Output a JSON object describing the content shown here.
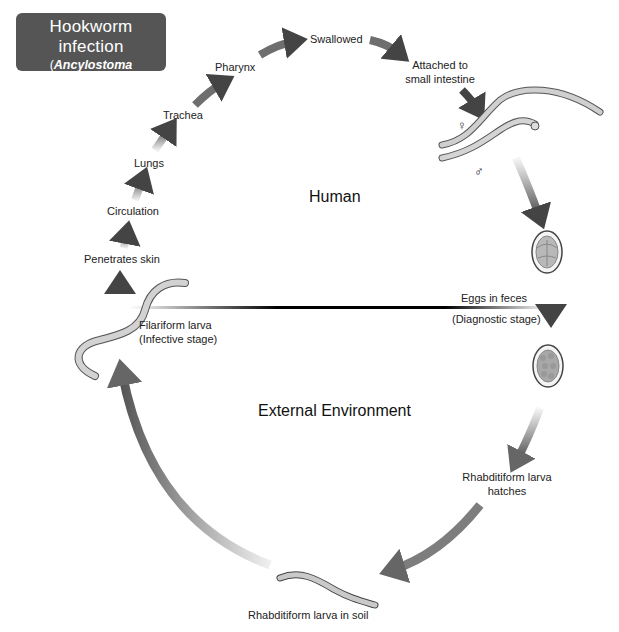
{
  "title": {
    "main": "Hookworm infection",
    "species_line1": "Ancylostoma duodenale,",
    "species_line2": "Necator americanus",
    "open_paren": "(",
    "close_paren": ")"
  },
  "regions": {
    "human": "Human",
    "external": "External Environment"
  },
  "stages": {
    "swallowed": "Swallowed",
    "attached_line1": "Attached to",
    "attached_line2": "small intestine",
    "pharynx": "Pharynx",
    "trachea": "Trachea",
    "lungs": "Lungs",
    "circulation": "Circulation",
    "penetrates_skin": "Penetrates skin",
    "filariform_line1": "Filariform larva",
    "filariform_line2": "(Infective stage)",
    "eggs_in_feces": "Eggs in feces",
    "diagnostic_stage": "(Diagnostic stage)",
    "rhabditiform_hatches_line1": "Rhabditiform larva",
    "rhabditiform_hatches_line2": "hatches",
    "rhabditiform_soil": "Rhabditiform larva in soil"
  },
  "symbols": {
    "female": "♀",
    "male": "♂"
  },
  "colors": {
    "title_bg": "#555555",
    "arrow": "#4a4a4a",
    "divider": "#000000",
    "worm_fill": "#c8c8c8",
    "worm_stroke": "#555555",
    "egg_fill": "#b0b0b0"
  }
}
